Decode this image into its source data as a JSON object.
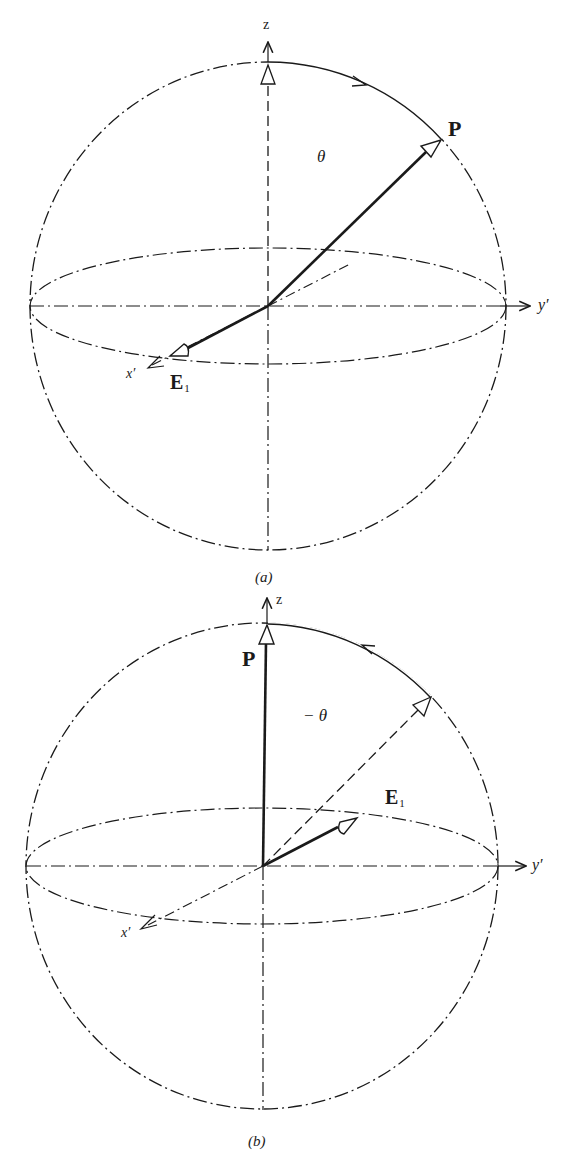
{
  "figures": [
    {
      "caption": "(a)",
      "axes": {
        "z": "z",
        "y": "y′",
        "x": "x′"
      },
      "vectors": {
        "p_label": "P",
        "e_label": "E",
        "e_subscript": "1"
      },
      "angle_label": "θ",
      "arc_direction": "clockwise (from z toward P)"
    },
    {
      "caption": "(b)",
      "axes": {
        "z": "z",
        "y": "y′",
        "x": "x′"
      },
      "vectors": {
        "p_label": "P",
        "e_label": "E",
        "e_subscript": "1"
      },
      "angle_label": "− θ",
      "arc_direction": "counter-clockwise (toward z)"
    }
  ],
  "colors": {
    "ink": "#1a1a1a",
    "background": "#ffffff"
  }
}
